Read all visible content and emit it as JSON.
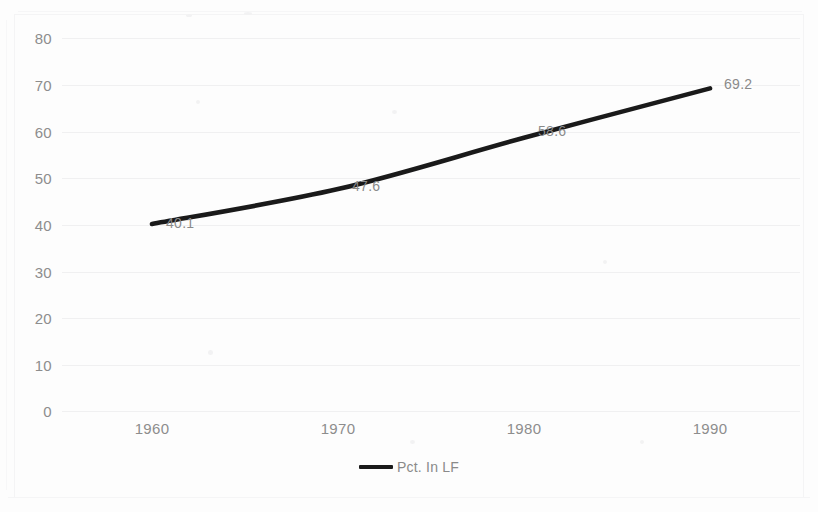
{
  "chart_data": {
    "type": "line",
    "title": "",
    "xlabel": "",
    "ylabel": "",
    "categories": [
      "1960",
      "1970",
      "1980",
      "1990"
    ],
    "series": [
      {
        "name": "Pct. In LF",
        "values": [
          40.1,
          47.6,
          58.6,
          69.2
        ],
        "color": "#1a1a1a"
      }
    ],
    "data_labels": [
      "40.1",
      "47.6",
      "58.6",
      "69.2"
    ],
    "ylim": [
      0,
      80
    ],
    "ytick_values": [
      80,
      70,
      60,
      50,
      40,
      30,
      20,
      10,
      0
    ],
    "ytick_labels": [
      "80",
      "70",
      "60",
      "50",
      "40",
      "30",
      "20",
      "10",
      "0"
    ],
    "xtick_labels": [
      "1960",
      "1970",
      "1980",
      "1990"
    ],
    "grid": "horizontal",
    "legend_position": "bottom",
    "legend_entries": [
      "Pct. In LF"
    ]
  },
  "legend": {
    "series_label": "Pct. In LF"
  },
  "axes": {
    "y": {
      "t0": "80",
      "t1": "70",
      "t2": "60",
      "t3": "50",
      "t4": "40",
      "t5": "30",
      "t6": "20",
      "t7": "10",
      "t8": "0"
    },
    "x": {
      "t0": "1960",
      "t1": "1970",
      "t2": "1980",
      "t3": "1990"
    }
  },
  "labels": {
    "p0": "40.1",
    "p1": "47.6",
    "p2": "58.6",
    "p3": "69.2"
  },
  "colors": {
    "series_line": "#1a1a1a",
    "gridline": "#f0f0f1",
    "tick_text": "#8d8d8d",
    "label_text": "#8a8a8a",
    "background": "#fdfdfd"
  }
}
